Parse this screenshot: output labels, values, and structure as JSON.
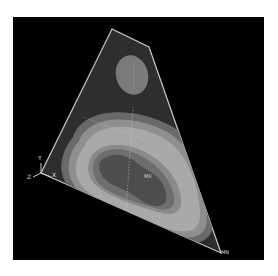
{
  "viewport": {
    "background": "#000000",
    "plate_outline_color": "#c8c8c8"
  },
  "contour_bands": [
    {
      "name": "outer-dark",
      "color": "#2e2e2e"
    },
    {
      "name": "band-1",
      "color": "#6a6a6a"
    },
    {
      "name": "band-2",
      "color": "#8f8f8f"
    },
    {
      "name": "band-3",
      "color": "#a9a9a9"
    },
    {
      "name": "band-4",
      "color": "#8a8a8a"
    },
    {
      "name": "band-5",
      "color": "#6e6e6e"
    },
    {
      "name": "core",
      "color": "#4e4e4e"
    },
    {
      "name": "upper-island",
      "color": "#7a7a7a"
    }
  ],
  "triad": {
    "y_label": "Y",
    "z_label": "Z",
    "x_label": "X"
  },
  "markers": {
    "max_label": "MX",
    "min_label": "MN"
  }
}
